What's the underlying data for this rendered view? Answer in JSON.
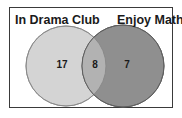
{
  "diagram": {
    "type": "venn",
    "sets": [
      {
        "label": "In Drama Club",
        "color": "#d2d2d2",
        "only_count": "17"
      },
      {
        "label": "Enjoy Math",
        "color": "#8f8f8f",
        "only_count": "7"
      }
    ],
    "intersection_count": "8",
    "intersection_color": "#b0b0b0",
    "outline_color": "#6e6e6e"
  }
}
